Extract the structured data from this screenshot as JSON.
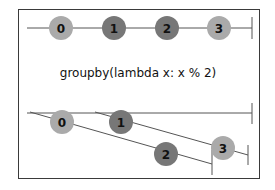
{
  "diagram": {
    "title": "groupby(lambda x: x % 2)",
    "colors": {
      "light": "#aaaaaa",
      "dark": "#777777",
      "line": "#555555",
      "frame": "#3a3a3a"
    },
    "input_stream": {
      "items": [
        {
          "label": "0",
          "shade": "light"
        },
        {
          "label": "1",
          "shade": "dark"
        },
        {
          "label": "2",
          "shade": "dark"
        },
        {
          "label": "3",
          "shade": "light"
        }
      ]
    },
    "output_streams": {
      "outer": {
        "label": "groups stream"
      },
      "group_0": {
        "items": [
          {
            "label": "0",
            "shade": "light"
          },
          {
            "label": "2",
            "shade": "dark"
          }
        ]
      },
      "group_1": {
        "items": [
          {
            "label": "1",
            "shade": "dark"
          },
          {
            "label": "3",
            "shade": "light"
          }
        ]
      }
    }
  }
}
